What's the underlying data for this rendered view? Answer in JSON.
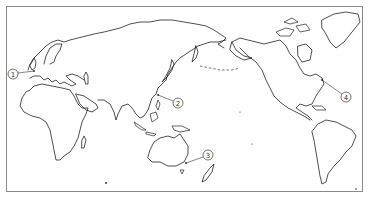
{
  "map": {
    "projection": "Pacific-centered world map",
    "markers": [
      {
        "id": 1,
        "label": "①",
        "text": "1",
        "cx": 13,
        "cy": 74,
        "target": [
          34,
          72
        ]
      },
      {
        "id": 2,
        "label": "②",
        "text": "2",
        "cx": 178,
        "cy": 103,
        "target": [
          158,
          96
        ]
      },
      {
        "id": 3,
        "label": "③",
        "text": "3",
        "cx": 208,
        "cy": 155,
        "target": [
          186,
          163
        ]
      },
      {
        "id": 4,
        "label": "④",
        "text": "4",
        "cx": 346,
        "cy": 97,
        "target": [
          322,
          80
        ]
      }
    ]
  },
  "colors": {
    "frame": "#8a8a8a",
    "coastline": "#222222",
    "background": "#ffffff"
  }
}
